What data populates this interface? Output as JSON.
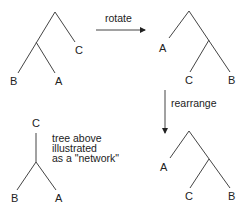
{
  "trees": {
    "original": {
      "leaves": [
        "B",
        "A",
        "C"
      ]
    },
    "rotated": {
      "leaves": [
        "A",
        "C",
        "B"
      ]
    },
    "rearranged": {
      "leaves": [
        "A",
        "C",
        "B"
      ]
    },
    "network": {
      "leaves": [
        "C",
        "B",
        "A"
      ]
    }
  },
  "arrows": {
    "rotate": {
      "label": "rotate"
    },
    "rearrange": {
      "label": "rearrange"
    }
  },
  "note": {
    "lines": [
      "tree above",
      "illustrated",
      "as a \"network\""
    ]
  }
}
